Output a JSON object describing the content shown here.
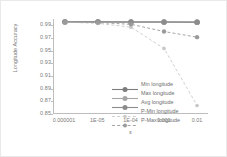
{
  "chart_data": {
    "type": "line",
    "title": "",
    "xlabel": "ε",
    "ylabel": "Longitude Accuracy",
    "categories": [
      "0.000001",
      "1E-05",
      "1E-04",
      "0.001",
      "0.01"
    ],
    "ylim": [
      0.85,
      1.0
    ],
    "yticks": [
      "0.99",
      "0.97",
      "0.95",
      "0.93",
      "0.91",
      "0.89",
      "0.87",
      "0.85"
    ],
    "ytick_values": [
      0.99,
      0.97,
      0.95,
      0.93,
      0.91,
      0.89,
      0.87,
      0.85
    ],
    "grid": false,
    "legend_position": "inside-left-center",
    "series": [
      {
        "name": "Min longitude",
        "values": [
          0.9955,
          0.9955,
          0.9952,
          0.9952,
          0.995
        ],
        "style": "solid",
        "color": "#7d7d7d",
        "marker": "diamond"
      },
      {
        "name": "Max longitude",
        "values": [
          0.9953,
          0.9953,
          0.995,
          0.995,
          0.9948
        ],
        "style": "solid",
        "color": "#a6a6a6",
        "marker": "triangle"
      },
      {
        "name": "Avg longitude",
        "values": [
          0.9954,
          0.9954,
          0.9951,
          0.9951,
          0.9949
        ],
        "style": "solid",
        "color": "#8c8c8c",
        "marker": "circle"
      },
      {
        "name": "P-Min longitude",
        "values": [
          0.995,
          0.993,
          0.987,
          0.953,
          0.862
        ],
        "style": "dashed",
        "color": "#c9c9c9",
        "marker": "plus"
      },
      {
        "name": "P-Max longitude",
        "values": [
          0.9952,
          0.9944,
          0.9915,
          0.98,
          0.971
        ],
        "style": "dashed",
        "color": "#9a9a9a",
        "marker": "triangle"
      }
    ]
  }
}
